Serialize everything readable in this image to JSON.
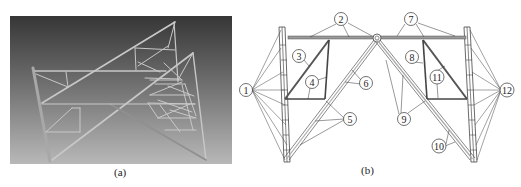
{
  "figure": {
    "panels": [
      {
        "id": "a",
        "caption": "(a)",
        "description": "3D rendered truss structure model on gray gradient background",
        "colors": {
          "background_top": "#3a3a3a",
          "background_bottom": "#b5b5b5",
          "member": "#c9c9c9"
        }
      },
      {
        "id": "b",
        "caption": "(b)",
        "description": "Line drawing of truss structure with numbered component callouts",
        "labels": [
          "1",
          "2",
          "3",
          "4",
          "5",
          "6",
          "7",
          "8",
          "9",
          "10",
          "11",
          "12"
        ]
      }
    ]
  },
  "captions": {
    "a": "(a)",
    "b": "(b)"
  },
  "callouts": {
    "c1": "1",
    "c2": "2",
    "c3": "3",
    "c4": "4",
    "c5": "5",
    "c6": "6",
    "c7": "7",
    "c8": "8",
    "c9": "9",
    "c10": "10",
    "c11": "11",
    "c12": "12"
  }
}
